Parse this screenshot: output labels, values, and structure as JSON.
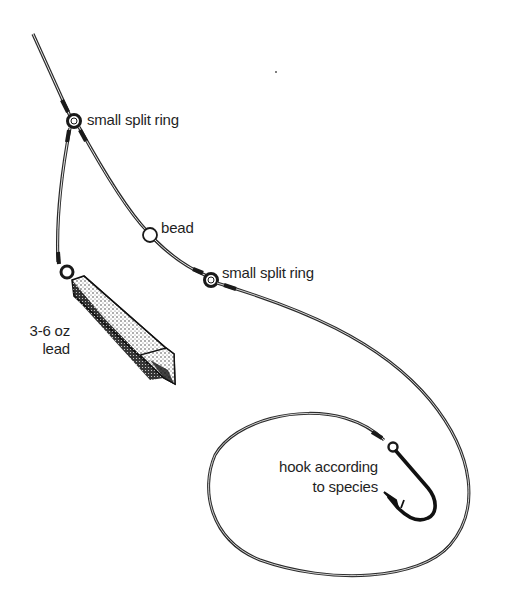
{
  "diagram": {
    "type": "fishing-rig-illustration",
    "labels": {
      "top_ring": "small split ring",
      "bead": "bead",
      "second_ring": "small split ring",
      "lead_line1": "3-6 oz",
      "lead_line2": "lead",
      "hook_line1": "hook according",
      "hook_line2": "to species"
    },
    "components": [
      {
        "id": "main-line",
        "kind": "line"
      },
      {
        "id": "top-split-ring",
        "kind": "split-ring"
      },
      {
        "id": "lead-link",
        "kind": "line"
      },
      {
        "id": "lead-weight",
        "kind": "weight",
        "label": "3-6 oz lead"
      },
      {
        "id": "bead",
        "kind": "bead"
      },
      {
        "id": "second-split-ring",
        "kind": "split-ring"
      },
      {
        "id": "hook-trace",
        "kind": "line"
      },
      {
        "id": "hook",
        "kind": "hook",
        "label": "hook according to species"
      }
    ],
    "colors": {
      "ink": "#1f1f1f",
      "background": "#ffffff"
    }
  }
}
